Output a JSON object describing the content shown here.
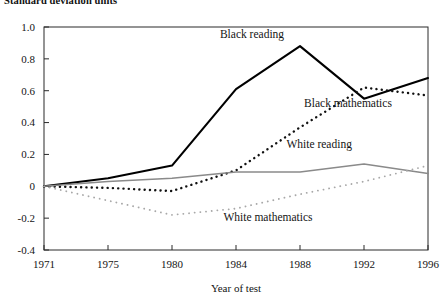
{
  "figure": {
    "supra_label": "Standard deviation units"
  },
  "chart_data": {
    "type": "line",
    "title": "",
    "subtitle": "",
    "supra_axis_label": "Standard deviation units",
    "xlabel": "Year of test",
    "ylabel": "Standard deviation units",
    "categories": [
      "1971",
      "1975",
      "1980",
      "1984",
      "1988",
      "1992",
      "1996"
    ],
    "x_tick_labels": [
      "1971",
      "1975",
      "1980",
      "1984",
      "1988",
      "1992",
      "1996"
    ],
    "y_tick_labels": [
      "1.0",
      "0.8",
      "0.6",
      "0.4",
      "0.2",
      "0",
      "-0.2",
      "-0.4"
    ],
    "y_tick_values": [
      1.0,
      0.8,
      0.6,
      0.4,
      0.2,
      0,
      -0.2,
      -0.4
    ],
    "ylim": [
      -0.4,
      1.0
    ],
    "grid": false,
    "legend": "inline-annotations",
    "series": [
      {
        "name": "Black reading",
        "style": "solid",
        "color": "#000000",
        "width": 2.1,
        "values": [
          0.0,
          0.05,
          0.13,
          0.61,
          0.88,
          0.55,
          0.68
        ],
        "label_x": 1985.0,
        "label_y": 0.93
      },
      {
        "name": "Black mathematics",
        "style": "dotted-bold",
        "color": "#111111",
        "width": 2.4,
        "values": [
          0.0,
          -0.01,
          -0.03,
          0.1,
          0.37,
          0.62,
          0.57
        ],
        "label_x": 1991.0,
        "label_y": 0.5
      },
      {
        "name": "White reading",
        "style": "solid",
        "color": "#8a8a8a",
        "width": 1.5,
        "values": [
          0.0,
          0.03,
          0.05,
          0.09,
          0.09,
          0.14,
          0.08
        ],
        "label_x": 1989.2,
        "label_y": 0.24
      },
      {
        "name": "White mathematics",
        "style": "dotted-light",
        "color": "#a8a8a8",
        "width": 1.8,
        "values": [
          0.0,
          -0.09,
          -0.18,
          -0.14,
          -0.05,
          0.03,
          0.13
        ],
        "label_x": 1986.0,
        "label_y": -0.22
      }
    ]
  }
}
